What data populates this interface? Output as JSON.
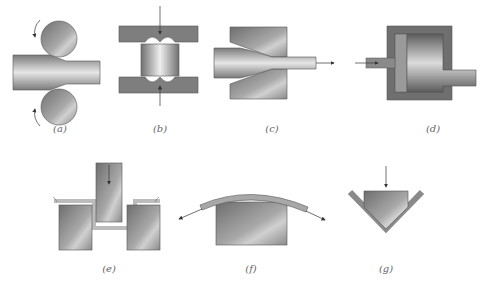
{
  "diagram": {
    "panels": [
      {
        "id": "a",
        "label": "(a)",
        "process": "rolling"
      },
      {
        "id": "b",
        "label": "(b)",
        "process": "forging"
      },
      {
        "id": "c",
        "label": "(c)",
        "process": "drawing"
      },
      {
        "id": "d",
        "label": "(d)",
        "process": "extrusion"
      },
      {
        "id": "e",
        "label": "(e)",
        "process": "deep drawing"
      },
      {
        "id": "f",
        "label": "(f)",
        "process": "stretch forming"
      },
      {
        "id": "g",
        "label": "(g)",
        "process": "bending"
      }
    ]
  },
  "colors": {
    "tool_dark": "#5a5a5a",
    "tool_mid": "#8c8c8c",
    "tool_light": "#c8c8c8",
    "work_light": "#e8e8e8",
    "background": "#ffffff",
    "arrow": "#333333"
  }
}
